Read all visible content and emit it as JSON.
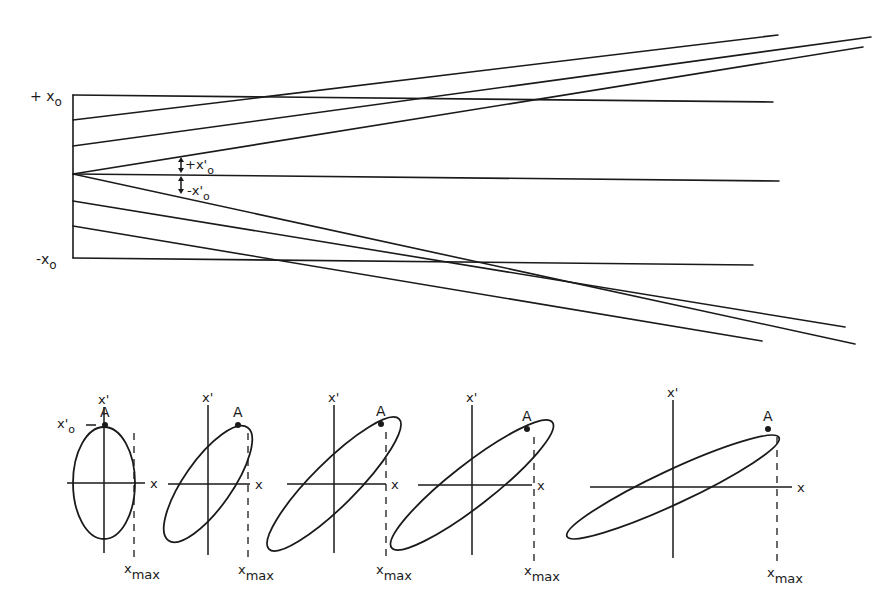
{
  "beam_envelope": {
    "labels": {
      "plus_x0": "+ x",
      "plus_x0_sub": "o",
      "minus_x0": "-x",
      "minus_x0_sub": "o",
      "plus_xprime0": "+x'",
      "plus_xprime0_sub": "o",
      "minus_xprime0": "-x'",
      "minus_xprime0_sub": "o"
    },
    "left_edge_x": 73,
    "rays": [
      {
        "name": "plus-x0-horizontal",
        "x1": 73,
        "y1": 95,
        "x2": 773,
        "y2": 102
      },
      {
        "name": "ray-upper-1",
        "x1": 73,
        "y1": 120,
        "x2": 778,
        "y2": 35
      },
      {
        "name": "ray-upper-2",
        "x1": 73,
        "y1": 146,
        "x2": 871,
        "y2": 37
      },
      {
        "name": "ray-upper-3",
        "x1": 73,
        "y1": 174,
        "x2": 863,
        "y2": 47
      },
      {
        "name": "center-horizontal",
        "x1": 73,
        "y1": 174,
        "x2": 779,
        "y2": 181
      },
      {
        "name": "ray-lower-3",
        "x1": 73,
        "y1": 174,
        "x2": 855,
        "y2": 344
      },
      {
        "name": "ray-lower-2",
        "x1": 73,
        "y1": 201,
        "x2": 845,
        "y2": 327
      },
      {
        "name": "ray-lower-1",
        "x1": 73,
        "y1": 226,
        "x2": 762,
        "y2": 341
      },
      {
        "name": "minus-x0-horizontal",
        "x1": 73,
        "y1": 258,
        "x2": 753,
        "y2": 265
      }
    ]
  },
  "phase_ellipses": {
    "axis_x_label": "x",
    "axis_xprime_label": "x'",
    "point_label": "A",
    "xmax_label": "x",
    "xmax_sub": "max",
    "xprime0_label": "x'",
    "xprime0_sub": "o",
    "panels": [
      {
        "name": "panel-1",
        "cx": 104,
        "cy": 483,
        "rx": 31,
        "ry": 56,
        "rot": 0,
        "hx1": 67,
        "hx2": 145,
        "vy1": 407,
        "vy2": 553,
        "ax": 105,
        "ay": 425,
        "xmax_x": 134,
        "show_xprime0": true
      },
      {
        "name": "panel-2",
        "cx": 208,
        "cy": 484,
        "rx": 69,
        "ry": 24,
        "rot": -55,
        "hx1": 168,
        "hx2": 250,
        "vy1": 405,
        "vy2": 555,
        "ax": 238,
        "ay": 425,
        "xmax_x": 248,
        "show_xprime0": false
      },
      {
        "name": "panel-3",
        "cx": 334,
        "cy": 484,
        "rx": 92,
        "ry": 22,
        "rot": -45,
        "hx1": 287,
        "hx2": 386,
        "vy1": 405,
        "vy2": 553,
        "ax": 381,
        "ay": 424,
        "xmax_x": 386,
        "show_xprime0": false
      },
      {
        "name": "panel-4",
        "cx": 472,
        "cy": 485,
        "rx": 102,
        "ry": 21,
        "rot": -38,
        "hx1": 418,
        "hx2": 532,
        "vy1": 405,
        "vy2": 555,
        "ax": 527,
        "ay": 429,
        "xmax_x": 534,
        "show_xprime0": false
      },
      {
        "name": "panel-5",
        "cx": 673,
        "cy": 487,
        "rx": 117,
        "ry": 17,
        "rot": -25,
        "hx1": 590,
        "hx2": 792,
        "vy1": 400,
        "vy2": 558,
        "ax": 768,
        "ay": 429,
        "xmax_x": 777,
        "show_xprime0": false
      }
    ]
  }
}
